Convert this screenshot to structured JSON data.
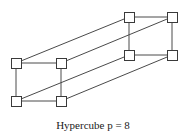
{
  "figure": {
    "caption": "Hypercube p = 8",
    "title": "Hypercube p = 8",
    "node_count": 8,
    "node_shape": "square",
    "node_size_px": 10,
    "colors": {
      "background": "#ffffff",
      "edge": "#4a4a4a",
      "node_stroke": "#3a3a3a",
      "node_fill": "#ffffff",
      "caption_text": "#1a1a1a"
    },
    "nodes": [
      {
        "id": "n0",
        "label": "",
        "group": "front",
        "cx": 16,
        "cy": 63
      },
      {
        "id": "n1",
        "label": "",
        "group": "front",
        "cx": 61,
        "cy": 63
      },
      {
        "id": "n2",
        "label": "",
        "group": "front",
        "cx": 16,
        "cy": 101
      },
      {
        "id": "n3",
        "label": "",
        "group": "front",
        "cx": 61,
        "cy": 101
      },
      {
        "id": "n4",
        "label": "",
        "group": "back",
        "cx": 129,
        "cy": 17
      },
      {
        "id": "n5",
        "label": "",
        "group": "back",
        "cx": 172,
        "cy": 17
      },
      {
        "id": "n6",
        "label": "",
        "group": "back",
        "cx": 129,
        "cy": 55
      },
      {
        "id": "n7",
        "label": "",
        "group": "back",
        "cx": 172,
        "cy": 55
      }
    ],
    "edges": [
      {
        "from": "n0",
        "to": "n1",
        "kind": "front-top"
      },
      {
        "from": "n0",
        "to": "n2",
        "kind": "front-left"
      },
      {
        "from": "n1",
        "to": "n3",
        "kind": "front-right"
      },
      {
        "from": "n2",
        "to": "n3",
        "kind": "front-bottom"
      },
      {
        "from": "n4",
        "to": "n5",
        "kind": "back-top"
      },
      {
        "from": "n4",
        "to": "n6",
        "kind": "back-left"
      },
      {
        "from": "n5",
        "to": "n7",
        "kind": "back-right"
      },
      {
        "from": "n6",
        "to": "n7",
        "kind": "back-bottom"
      },
      {
        "from": "n0",
        "to": "n4",
        "kind": "connector"
      },
      {
        "from": "n1",
        "to": "n5",
        "kind": "connector"
      },
      {
        "from": "n2",
        "to": "n6",
        "kind": "connector"
      },
      {
        "from": "n3",
        "to": "n7",
        "kind": "connector"
      }
    ]
  }
}
